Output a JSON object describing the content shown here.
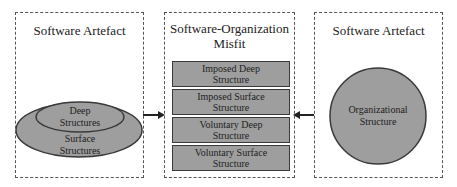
{
  "diagram": {
    "left_box": {
      "title": "Software Artefact",
      "outer_ellipse_label": "Surface Structures",
      "outer_ellipse_line1": "Surface",
      "outer_ellipse_line2": "Structures",
      "inner_ellipse_line1": "Deep",
      "inner_ellipse_line2": "Structures"
    },
    "middle_box": {
      "title_line1": "Software-Organization",
      "title_line2": "Misfit",
      "rows": [
        {
          "line1": "Imposed Deep",
          "line2": "Structure"
        },
        {
          "line1": "Imposed Surface",
          "line2": "Structure"
        },
        {
          "line1": "Voluntary Deep",
          "line2": "Structure"
        },
        {
          "line1": "Voluntary Surface",
          "line2": "Structure"
        }
      ]
    },
    "right_box": {
      "title": "Software Artefact",
      "circle_line1": "Organizational",
      "circle_line2": "Structure"
    },
    "colors": {
      "shape_fill": "#9e9e9e",
      "shape_stroke": "#3a3a3a",
      "dashed_border": "#555555"
    }
  }
}
